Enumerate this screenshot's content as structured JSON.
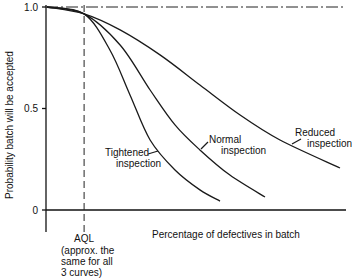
{
  "chart_data": {
    "type": "line",
    "title": "",
    "xlabel": "Percentage of defectives in batch",
    "ylabel": "Probability batch will be accepted",
    "ylim": [
      0,
      1.0
    ],
    "xlim": [
      0,
      100
    ],
    "x_units_note": "arbitrary relative scale (no numeric x ticks shown)",
    "yticks": [
      {
        "value": 0,
        "label": "0"
      },
      {
        "value": 0.5,
        "label": "0.5"
      },
      {
        "value": 1.0,
        "label": "1.0"
      }
    ],
    "reference_lines": [
      {
        "orientation": "horizontal",
        "value": 1.0,
        "style": "dash-dot"
      },
      {
        "orientation": "vertical",
        "value": 12.7,
        "style": "dashed",
        "label": "AQL"
      }
    ],
    "aql_label": "AQL",
    "aql_note": [
      "(approx. the",
      "same for all",
      "3 curves)"
    ],
    "grid": false,
    "series": [
      {
        "name": "Tightened inspection",
        "label_lines": [
          "Tightened",
          "inspection"
        ],
        "x": [
          0.3,
          12.7,
          21.3,
          28,
          34.7,
          43,
          51.3,
          58
        ],
        "y": [
          1.0,
          0.966,
          0.788,
          0.567,
          0.345,
          0.197,
          0.099,
          0.044
        ]
      },
      {
        "name": "Normal inspection",
        "label_lines": [
          "Normal",
          "inspection"
        ],
        "x": [
          0.3,
          12.7,
          24.7,
          34.7,
          43,
          51.3,
          61.3,
          73
        ],
        "y": [
          1.0,
          0.966,
          0.813,
          0.591,
          0.419,
          0.296,
          0.172,
          0.064
        ]
      },
      {
        "name": "Reduced inspection",
        "label_lines": [
          "Reduced",
          "inspection"
        ],
        "x": [
          0.3,
          12.7,
          24.7,
          38,
          51.3,
          64.7,
          78,
          98
        ],
        "y": [
          1.0,
          0.966,
          0.887,
          0.764,
          0.616,
          0.468,
          0.345,
          0.207
        ]
      }
    ]
  }
}
